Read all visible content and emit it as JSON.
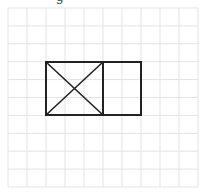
{
  "header": {
    "clipped_text": "g"
  },
  "grid": {
    "x_start": 8,
    "x_step": 19,
    "x_count": 11,
    "y_start": 8,
    "y_step": 17.9,
    "y_count": 11,
    "x_end": 198,
    "y_end": 187,
    "line_color": "#e3e3e3"
  },
  "figure": {
    "stroke_color": "#222222",
    "outer_rect": {
      "x": 46,
      "y": 62,
      "width": 95,
      "height": 53
    },
    "left_square": {
      "x": 46,
      "y": 62,
      "width": 57,
      "height": 53,
      "has_diagonals": true
    },
    "right_square": {
      "x": 103,
      "y": 62,
      "width": 38,
      "height": 53,
      "has_diagonals": false
    },
    "divider_x": 103
  }
}
